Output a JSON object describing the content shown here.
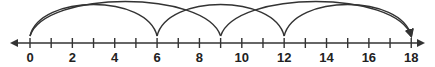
{
  "diagram": {
    "type": "number-line-jumps",
    "axis": {
      "min": 0,
      "max": 18,
      "tick_step": 1,
      "label_step": 2,
      "labels": [
        "0",
        "2",
        "4",
        "6",
        "8",
        "10",
        "12",
        "14",
        "16",
        "18"
      ],
      "arrows": "both"
    },
    "jump_series": [
      {
        "name": "jumps of 6",
        "points": [
          0,
          6,
          12,
          18
        ]
      },
      {
        "name": "jumps of 9",
        "points": [
          0,
          9,
          18
        ]
      }
    ],
    "colors": {
      "line": "#333333",
      "text": "#222222"
    }
  }
}
